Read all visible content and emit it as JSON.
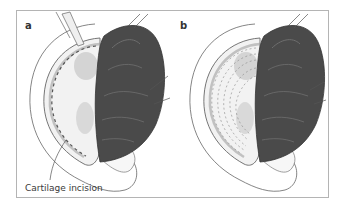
{
  "figure": {
    "panels": [
      {
        "label": "a",
        "annotation": "Cartilage incision"
      },
      {
        "label": "b"
      }
    ],
    "colors": {
      "frame": "#b4b4b4",
      "skin_flap": "#4a4a4a",
      "skin_flap_highlight": "#6e6e6e",
      "cartilage": "#f4f4f4",
      "cartilage_shadow": "#d2d2d2",
      "outline": "#555555",
      "incision_dash": "#555555"
    }
  }
}
